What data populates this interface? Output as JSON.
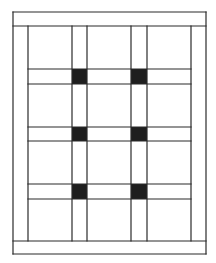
{
  "diagram": {
    "type": "grid-pattern line drawing",
    "colors": {
      "line": "#2a2a2a",
      "fill": "#1e1e1e",
      "background": "#ffffff"
    },
    "frame": {
      "left": 13,
      "right": 206,
      "top": 12,
      "bottom": 254
    },
    "bands": {
      "top_band_line_y": 26,
      "bottom_band_line_y": 241
    },
    "inner": {
      "left": 28,
      "right": 191
    },
    "vertical_lines_x": [
      28,
      72,
      87,
      131,
      147,
      191
    ],
    "horizontal_line_pairs_y": [
      [
        69,
        84
      ],
      [
        127,
        141
      ],
      [
        184,
        199
      ]
    ],
    "filled_squares": [
      {
        "x": 72,
        "y": 69,
        "w": 15,
        "h": 15
      },
      {
        "x": 131,
        "y": 69,
        "w": 16,
        "h": 15
      },
      {
        "x": 72,
        "y": 127,
        "w": 15,
        "h": 14
      },
      {
        "x": 131,
        "y": 127,
        "w": 16,
        "h": 14
      },
      {
        "x": 72,
        "y": 184,
        "w": 15,
        "h": 15
      },
      {
        "x": 131,
        "y": 184,
        "w": 16,
        "h": 15
      }
    ]
  }
}
